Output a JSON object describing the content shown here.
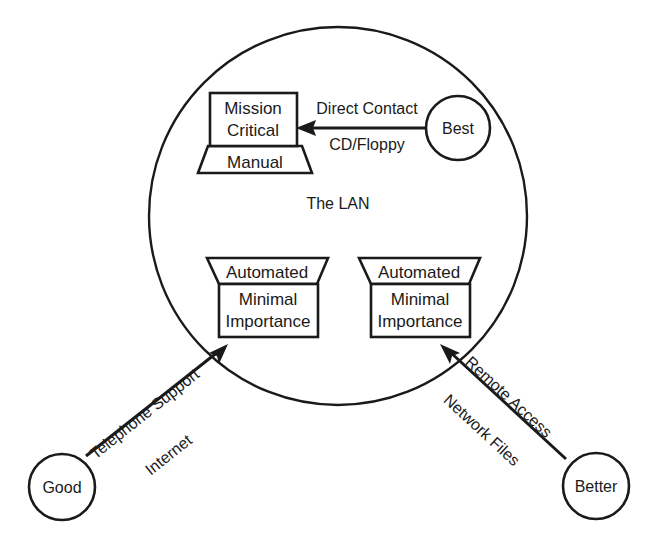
{
  "diagram": {
    "title": "The LAN",
    "lan": {
      "caption": "The LAN"
    },
    "assets": [
      {
        "id": "mission-critical",
        "kind": "laptop",
        "line1": "Mission",
        "line2": "Critical",
        "base_label": "Manual"
      },
      {
        "id": "minimal-importance-left",
        "kind": "terminal",
        "cap_label": "Automated",
        "line1": "Minimal",
        "line2": "Importance"
      },
      {
        "id": "minimal-importance-right",
        "kind": "terminal",
        "cap_label": "Automated",
        "line1": "Minimal",
        "line2": "Importance"
      }
    ],
    "ratings": [
      {
        "id": "best",
        "label": "Best"
      },
      {
        "id": "good",
        "label": "Good"
      },
      {
        "id": "better",
        "label": "Better"
      }
    ],
    "connections": [
      {
        "id": "best-to-mission-critical",
        "from": "best",
        "to": "mission-critical",
        "label_line1": "Direct Contact",
        "label_line2": "CD/Floppy"
      },
      {
        "id": "good-to-minimal-left",
        "from": "good",
        "to": "minimal-importance-left",
        "label_line1": "Telephone Support",
        "label_line2": "Internet"
      },
      {
        "id": "better-to-minimal-right",
        "from": "better",
        "to": "minimal-importance-right",
        "label_line1": "Remote Access",
        "label_line2": "Network Files"
      }
    ],
    "colors": {
      "ink": "#1a1a1a",
      "paper": "#ffffff"
    }
  }
}
